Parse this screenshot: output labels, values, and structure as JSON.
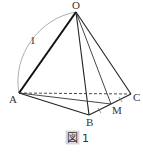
{
  "figure": {
    "caption": {
      "box_text": "図",
      "number": "1"
    },
    "points": {
      "O": {
        "label": "O",
        "x": 76,
        "y": 12
      },
      "A": {
        "label": "A",
        "x": 19,
        "y": 93
      },
      "B": {
        "label": "B",
        "x": 89,
        "y": 115
      },
      "C": {
        "label": "C",
        "x": 131,
        "y": 94
      },
      "M": {
        "label": "M",
        "x": 111,
        "y": 104
      }
    },
    "arc_label": "1",
    "colors": {
      "stroke": "#222222",
      "arc": "#888888",
      "caption_box": "#dddddd"
    }
  }
}
